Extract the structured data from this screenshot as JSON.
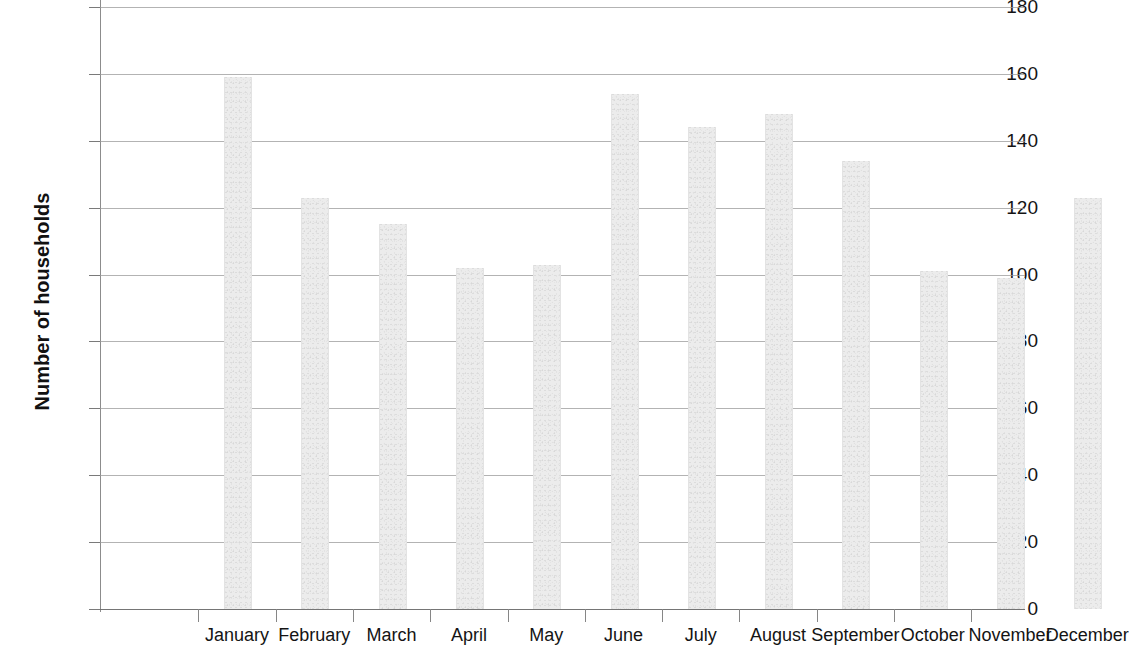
{
  "chart_data": {
    "type": "bar",
    "title": "",
    "subtitle": "",
    "xlabel": "",
    "ylabel": "Number of households",
    "categories": [
      "January",
      "February",
      "March",
      "April",
      "May",
      "June",
      "July",
      "August",
      "September",
      "October",
      "November",
      "December"
    ],
    "values": [
      159,
      123,
      115,
      102,
      103,
      154,
      144,
      148,
      134,
      101,
      99,
      123
    ],
    "series": [
      {
        "name": "Number of households",
        "values": [
          159,
          123,
          115,
          102,
          103,
          154,
          144,
          148,
          134,
          101,
          99,
          123
        ]
      }
    ],
    "ylim": [
      0,
      180
    ],
    "y_ticks": [
      0,
      20,
      40,
      60,
      80,
      100,
      120,
      140,
      160,
      180
    ],
    "y_tick_labels": [
      "0",
      "20",
      "40",
      "60",
      "80",
      "100",
      "120",
      "140",
      "160",
      "180"
    ],
    "grid": true,
    "grid_axis": "y",
    "legend": false,
    "legend_position": "none",
    "bar_color": "#ececec",
    "bar_edge_color": "#e3e3e3",
    "gridline_color": "#9a9a9a",
    "axis_color": "#8c8c8c",
    "text_color": "#141414",
    "background_color": "#ffffff"
  }
}
